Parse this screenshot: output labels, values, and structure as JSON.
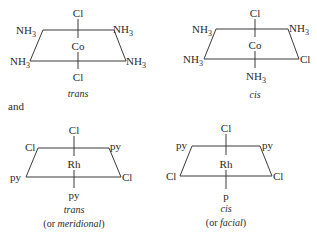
{
  "diagram": {
    "connector_text": "and",
    "complexes": [
      {
        "id": "co-trans",
        "metal": "Co",
        "caption": "trans",
        "subcaption": "",
        "ligands": {
          "top": "Cl",
          "bottom": "Cl",
          "top_left": "NH",
          "top_left_sub": "3",
          "top_right": "NH",
          "top_right_sub": "3",
          "bottom_left": "NH",
          "bottom_left_sub": "3",
          "bottom_right": "NH",
          "bottom_right_sub": "3"
        }
      },
      {
        "id": "co-cis",
        "metal": "Co",
        "caption": "cis",
        "subcaption": "",
        "ligands": {
          "top": "Cl",
          "bottom": "NH",
          "bottom_sub": "3",
          "top_left": "NH",
          "top_left_sub": "3",
          "top_right": "NH",
          "top_right_sub": "3",
          "bottom_left": "NH",
          "bottom_left_sub": "3",
          "bottom_right": "Cl"
        }
      },
      {
        "id": "rh-trans",
        "metal": "Rh",
        "caption": "trans",
        "subcaption_prefix": "(or ",
        "subcaption_em": "meridional",
        "subcaption_suffix": ")",
        "ligands": {
          "top": "Cl",
          "bottom": "py",
          "top_left": "Cl",
          "top_right": "py",
          "bottom_left": "py",
          "bottom_right": "Cl"
        }
      },
      {
        "id": "rh-cis",
        "metal": "Rh",
        "caption": "cis",
        "subcaption_prefix": "(or ",
        "subcaption_em": "facial",
        "subcaption_suffix": ")",
        "ligands": {
          "top": "Cl",
          "bottom": "p",
          "top_left": "py",
          "top_right": "py",
          "bottom_left": "Cl",
          "bottom_right": "Cl"
        }
      }
    ]
  }
}
